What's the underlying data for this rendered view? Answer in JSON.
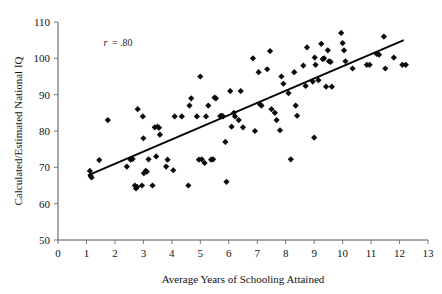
{
  "chart_data": {
    "type": "scatter",
    "title": "",
    "xlabel": "Average Years of Schooling Attained",
    "ylabel": "Calculated/Estimated National IQ",
    "xlim": [
      0,
      13
    ],
    "ylim": [
      50,
      110
    ],
    "xticks": [
      0,
      1,
      2,
      3,
      4,
      5,
      6,
      7,
      8,
      9,
      10,
      11,
      12,
      13
    ],
    "yticks": [
      50,
      60,
      70,
      80,
      90,
      100,
      110
    ],
    "grid": false,
    "legend": null,
    "annotations": [
      {
        "name": "correlation-annotation",
        "symbol": "r",
        "operator": "=",
        "value": ".80",
        "text": "r = .80",
        "x": 1.6,
        "y": 103.5
      }
    ],
    "trend_line": {
      "name": "regression-line",
      "x0": 1.05,
      "y0": 67.8,
      "x1": 12.15,
      "y1": 105.0,
      "slope": 3.35,
      "intercept": 64.3,
      "color": "#000000"
    },
    "marker": {
      "shape": "diamond",
      "color": "#0b0b0b",
      "size": 3.1
    },
    "points": [
      [
        1.12,
        69.0
      ],
      [
        1.15,
        67.6
      ],
      [
        1.18,
        67.2
      ],
      [
        1.45,
        72.0
      ],
      [
        1.75,
        83.0
      ],
      [
        2.42,
        70.2
      ],
      [
        2.55,
        72.1
      ],
      [
        2.62,
        72.3
      ],
      [
        2.7,
        65.0
      ],
      [
        2.74,
        64.2
      ],
      [
        2.78,
        64.6
      ],
      [
        2.8,
        86.0
      ],
      [
        2.95,
        65.0
      ],
      [
        2.98,
        84.0
      ],
      [
        3.0,
        78.0
      ],
      [
        3.02,
        68.4
      ],
      [
        3.08,
        69.0
      ],
      [
        3.12,
        68.8
      ],
      [
        3.18,
        72.2
      ],
      [
        3.32,
        65.0
      ],
      [
        3.4,
        81.0
      ],
      [
        3.45,
        73.0
      ],
      [
        3.5,
        81.2
      ],
      [
        3.55,
        80.9
      ],
      [
        3.58,
        79.0
      ],
      [
        3.8,
        70.2
      ],
      [
        3.85,
        72.1
      ],
      [
        4.05,
        69.2
      ],
      [
        4.1,
        84.0
      ],
      [
        4.35,
        84.0
      ],
      [
        4.58,
        65.0
      ],
      [
        4.62,
        87.0
      ],
      [
        4.68,
        89.0
      ],
      [
        4.88,
        84.0
      ],
      [
        4.95,
        72.1
      ],
      [
        5.0,
        95.0
      ],
      [
        5.05,
        72.2
      ],
      [
        5.15,
        71.2
      ],
      [
        5.2,
        84.0
      ],
      [
        5.28,
        87.0
      ],
      [
        5.38,
        72.1
      ],
      [
        5.45,
        72.2
      ],
      [
        5.5,
        89.2
      ],
      [
        5.55,
        89.0
      ],
      [
        5.7,
        84.1
      ],
      [
        5.75,
        84.2
      ],
      [
        5.8,
        84.0
      ],
      [
        5.88,
        77.0
      ],
      [
        5.92,
        66.0
      ],
      [
        6.05,
        91.0
      ],
      [
        6.1,
        81.2
      ],
      [
        6.18,
        85.0
      ],
      [
        6.22,
        84.0
      ],
      [
        6.35,
        83.0
      ],
      [
        6.42,
        91.0
      ],
      [
        6.5,
        81.0
      ],
      [
        6.85,
        100.0
      ],
      [
        6.92,
        80.0
      ],
      [
        7.05,
        96.2
      ],
      [
        7.1,
        87.3
      ],
      [
        7.15,
        87.0
      ],
      [
        7.35,
        97.0
      ],
      [
        7.45,
        102.0
      ],
      [
        7.5,
        86.0
      ],
      [
        7.62,
        85.0
      ],
      [
        7.68,
        83.0
      ],
      [
        7.8,
        80.2
      ],
      [
        7.85,
        95.0
      ],
      [
        7.92,
        93.0
      ],
      [
        8.1,
        90.4
      ],
      [
        8.18,
        72.2
      ],
      [
        8.3,
        96.2
      ],
      [
        8.35,
        87.0
      ],
      [
        8.4,
        84.2
      ],
      [
        8.62,
        98.0
      ],
      [
        8.7,
        92.4
      ],
      [
        8.75,
        103.0
      ],
      [
        8.95,
        93.6
      ],
      [
        9.0,
        78.2
      ],
      [
        9.02,
        100.2
      ],
      [
        9.05,
        98.2
      ],
      [
        9.15,
        94.0
      ],
      [
        9.25,
        104.0
      ],
      [
        9.3,
        99.8
      ],
      [
        9.35,
        100.0
      ],
      [
        9.42,
        92.2
      ],
      [
        9.48,
        102.2
      ],
      [
        9.52,
        99.2
      ],
      [
        9.58,
        99.0
      ],
      [
        9.62,
        92.2
      ],
      [
        9.95,
        107.0
      ],
      [
        10.0,
        104.2
      ],
      [
        10.05,
        102.2
      ],
      [
        10.1,
        99.2
      ],
      [
        10.35,
        97.2
      ],
      [
        10.85,
        98.2
      ],
      [
        10.95,
        98.2
      ],
      [
        11.2,
        101.2
      ],
      [
        11.28,
        101.0
      ],
      [
        11.45,
        106.0
      ],
      [
        11.5,
        97.2
      ],
      [
        11.8,
        100.2
      ],
      [
        12.1,
        98.2
      ],
      [
        12.22,
        98.2
      ]
    ]
  },
  "figure": {
    "background_color": "#ffffff",
    "axis_color": "#555555"
  }
}
